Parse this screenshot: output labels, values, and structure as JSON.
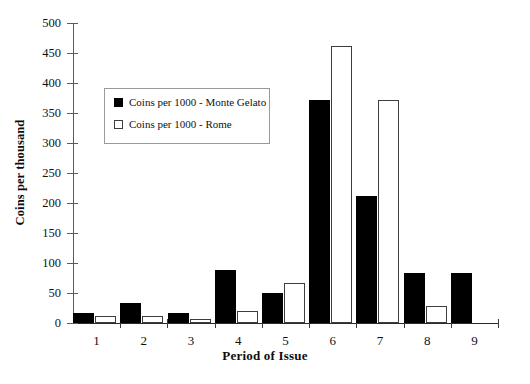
{
  "chart_data": {
    "type": "bar",
    "title": "",
    "xlabel": "Period of Issue",
    "ylabel": "Coins per thousand",
    "categories": [
      "1",
      "2",
      "3",
      "4",
      "5",
      "6",
      "7",
      "8",
      "9"
    ],
    "ylim": [
      0,
      500
    ],
    "ytick_labels": [
      "0",
      "50",
      "100",
      "150",
      "200",
      "250",
      "300",
      "350",
      "400",
      "450",
      "500"
    ],
    "ytick_values": [
      0,
      50,
      100,
      150,
      200,
      250,
      300,
      350,
      400,
      450,
      500
    ],
    "grid": false,
    "legend_position": "upper-left-inside",
    "series": [
      {
        "name": "Coins per 1000 - Monte Gelato",
        "color": "#000000",
        "style": "filled",
        "values": [
          17,
          34,
          16,
          88,
          50,
          372,
          212,
          84,
          83
        ]
      },
      {
        "name": "Coins per 1000 - Rome",
        "color": "#ffffff",
        "style": "outlined",
        "values": [
          12,
          12,
          6,
          20,
          67,
          462,
          371,
          29,
          0
        ]
      }
    ]
  },
  "legend": {
    "items": [
      {
        "label": "Coins per 1000 - Monte Gelato",
        "swatch": "filled-black-square"
      },
      {
        "label": "Coins per 1000 - Rome",
        "swatch": "outlined-white-square"
      }
    ]
  }
}
